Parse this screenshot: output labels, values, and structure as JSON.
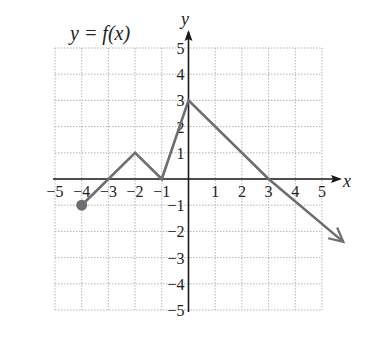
{
  "chart_data": {
    "type": "line",
    "title": "y = f(x)",
    "xlabel": "x",
    "ylabel": "y",
    "xlim": [
      -5,
      5
    ],
    "ylim": [
      -5,
      5
    ],
    "grid": true,
    "x_ticks": [
      -5,
      -4,
      -3,
      -2,
      -1,
      1,
      2,
      3,
      4,
      5
    ],
    "y_ticks": [
      -5,
      -4,
      -3,
      -2,
      -1,
      1,
      2,
      3,
      4,
      5
    ],
    "series": [
      {
        "name": "f(x)",
        "points": [
          [
            -4,
            -1
          ],
          [
            -2,
            1
          ],
          [
            -1,
            0
          ],
          [
            0,
            3
          ],
          [
            3,
            0
          ],
          [
            5.8,
            -2.4
          ]
        ],
        "start_marker": "closed-dot",
        "end_marker": "arrow",
        "color": "#6e6e6e"
      }
    ]
  },
  "labels": {
    "title": "y = f(x)",
    "x_axis": "x",
    "y_axis": "y"
  },
  "colors": {
    "grid": "#b5b5b5",
    "axis": "#1a1a1a",
    "curve": "#6e6e6e"
  }
}
